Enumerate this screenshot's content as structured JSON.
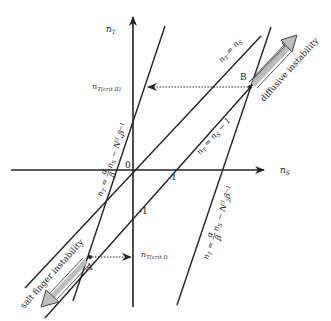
{
  "diagram": {
    "axes": {
      "x_label": "n",
      "x_label_sub": "S",
      "y_label": "n",
      "y_label_sub": "T",
      "origin_label": "0",
      "tick_one": "1",
      "tick_minus_one": "-1"
    },
    "lines": {
      "identity": {
        "lhs": "n",
        "lhs_sub": "T",
        "eq": " = n",
        "rhs_sub": "S"
      },
      "shifted": {
        "lhs": "n",
        "lhs_sub": "T",
        "eq": " = n",
        "rhs_sub": "S",
        "tail": " − 1"
      },
      "steep_left": {
        "label": "nₜ = (α/β) nₛ − N³ₗ β⁻¹"
      },
      "steep_right": {
        "label": "nₜ = (α/β) nₛ − N³₂ β⁻¹"
      }
    },
    "points": {
      "A": "A",
      "B": "B"
    },
    "critical": {
      "upper": {
        "main": "n",
        "sub": "T(crit II)"
      },
      "lower": {
        "main": "n",
        "sub": "T(crit I)"
      }
    },
    "arrows": {
      "diffusive": "diffusive instability",
      "salt_finger": "salt finger instability"
    },
    "colors": {
      "line": "#222222",
      "arrow_fill": "#bdbdbd",
      "arrow_stroke": "#555555"
    }
  }
}
